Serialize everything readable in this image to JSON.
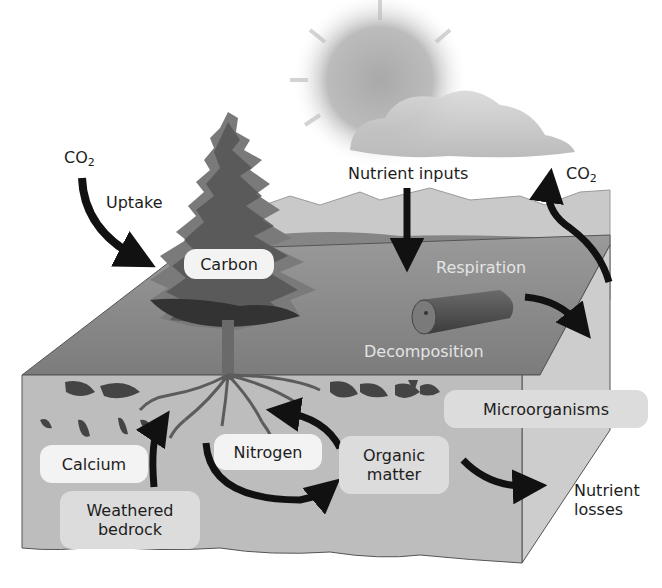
{
  "diagram": {
    "labels": {
      "co2_left": "CO",
      "co2_left_sub": "2",
      "uptake": "Uptake",
      "nutrient_inputs": "Nutrient inputs",
      "co2_right": "CO",
      "co2_right_sub": "2",
      "carbon": "Carbon",
      "respiration": "Respiration",
      "decomposition": "Decomposition",
      "microorganisms": "Microorganisms",
      "calcium": "Calcium",
      "nitrogen": "Nitrogen",
      "organic_matter_1": "Organic",
      "organic_matter_2": "matter",
      "weathered_bedrock_1": "Weathered",
      "weathered_bedrock_2": "bedrock",
      "nutrient_losses_1": "Nutrient",
      "nutrient_losses_2": "losses"
    },
    "colors": {
      "arrow": "#111111",
      "top_surface": "#8a8a8a",
      "front_face": "#bdbdbd",
      "side_face": "#cfcfcf",
      "tree": "#5a5a5a",
      "sky_cloud": "#b5b5b5"
    },
    "arrows": [
      {
        "from": "CO2 (air)",
        "to": "Carbon (tree)",
        "label": "Uptake"
      },
      {
        "from": "Nutrient inputs",
        "to": "ecosystem surface"
      },
      {
        "from": "Respiration",
        "to": "CO2 (air)"
      },
      {
        "from": "Decomposition (log)",
        "to": "soil"
      },
      {
        "from": "Weathered bedrock",
        "to": "Calcium / roots"
      },
      {
        "from": "roots",
        "to": "Organic matter"
      },
      {
        "from": "Organic matter",
        "to": "roots (Nitrogen)"
      },
      {
        "from": "Organic matter",
        "to": "Nutrient losses"
      }
    ]
  }
}
